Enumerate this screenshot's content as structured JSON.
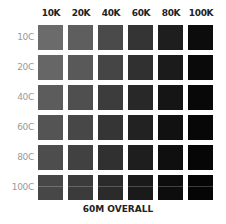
{
  "chart_data": {
    "type": "heatmap",
    "title": "60M OVERALL",
    "xlabel": "",
    "ylabel": "",
    "columns": [
      "10K",
      "20K",
      "40K",
      "60K",
      "80K",
      "100K"
    ],
    "rows": [
      "10C",
      "20C",
      "40C",
      "60C",
      "80C",
      "100C"
    ],
    "colors": [
      [
        "#6b6b6b",
        "#5e5e5e",
        "#4a4a4a",
        "#343434",
        "#1e1e1e",
        "#0c0c0c"
      ],
      [
        "#666666",
        "#595959",
        "#454545",
        "#303030",
        "#1b1b1b",
        "#0a0a0a"
      ],
      [
        "#5c5c5c",
        "#4f4f4f",
        "#3c3c3c",
        "#282828",
        "#151515",
        "#080808"
      ],
      [
        "#545454",
        "#474747",
        "#353535",
        "#222222",
        "#111111",
        "#070707"
      ],
      [
        "#4d4d4d",
        "#414141",
        "#303030",
        "#1e1e1e",
        "#0f0f0f",
        "#060606"
      ],
      [
        "#474747",
        "#3b3b3b",
        "#2b2b2b",
        "#1a1a1a",
        "#0d0d0d",
        "#050505"
      ]
    ],
    "legend": null,
    "grid": false
  }
}
